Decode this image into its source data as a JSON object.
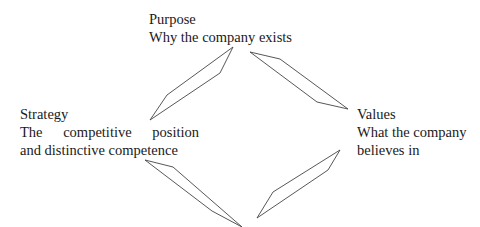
{
  "nodes": {
    "purpose": {
      "title": "Purpose",
      "desc": "Why the company exists"
    },
    "strategy": {
      "title": "Strategy",
      "desc_words": [
        "The",
        "competitive",
        "position"
      ],
      "desc_line2": "and distinctive competence"
    },
    "values": {
      "title": "Values",
      "desc_line1": "What the company",
      "desc_line2": "believes in"
    }
  },
  "connectors": [
    {
      "from": "strategy",
      "to": "purpose",
      "shape": "parallelogram-arrow"
    },
    {
      "from": "purpose",
      "to": "values",
      "shape": "parallelogram-arrow"
    },
    {
      "from": "values",
      "to": "bottom",
      "shape": "parallelogram-arrow"
    },
    {
      "from": "strategy",
      "to": "bottom",
      "shape": "parallelogram-arrow"
    }
  ],
  "colors": {
    "stroke": "#444444",
    "text": "#1a1a1a",
    "background": "#ffffff"
  }
}
